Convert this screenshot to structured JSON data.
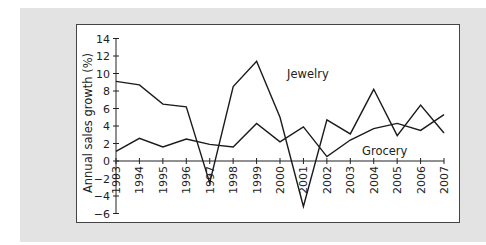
{
  "chart_data": {
    "type": "line",
    "title": "",
    "xlabel": "",
    "ylabel": "Annual sales growth (%)",
    "x": [
      1993,
      1994,
      1995,
      1996,
      1997,
      1998,
      1999,
      2000,
      2001,
      2002,
      2003,
      2004,
      2005,
      2006,
      2007
    ],
    "x_tick_labels": [
      "1993",
      "1994",
      "1995",
      "1996",
      "1997",
      "1998",
      "1999",
      "2000",
      "2001",
      "2002",
      "2003",
      "2004",
      "2005",
      "2006",
      "2007"
    ],
    "y_ticks": [
      -6,
      -4,
      -2,
      0,
      2,
      4,
      6,
      8,
      10,
      12,
      14
    ],
    "y_tick_labels": [
      "−6",
      "−4",
      "−2",
      "0",
      "2",
      "4",
      "6",
      "8",
      "10",
      "12",
      "14"
    ],
    "ylim": [
      -6,
      14
    ],
    "grid": false,
    "legend": "inline labels",
    "series": [
      {
        "name": "Jewelry",
        "values": [
          9.1,
          8.7,
          6.5,
          6.2,
          -2.5,
          8.5,
          11.4,
          5.0,
          -5.2,
          4.7,
          3.1,
          8.2,
          2.9,
          6.4,
          3.2
        ]
      },
      {
        "name": "Grocery",
        "values": [
          1.1,
          2.6,
          1.6,
          2.5,
          1.9,
          1.6,
          4.3,
          2.2,
          3.9,
          0.5,
          2.4,
          3.7,
          4.3,
          3.5,
          5.3
        ]
      }
    ],
    "annotations": [
      {
        "text": "Jewelry",
        "near_x": 2000.3,
        "near_y": 9.5
      },
      {
        "text": "Grocery",
        "near_x": 2003.5,
        "near_y": 0.7
      }
    ]
  }
}
